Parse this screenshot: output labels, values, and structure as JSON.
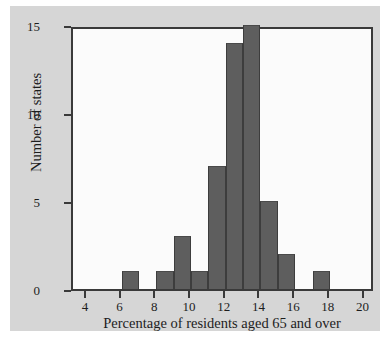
{
  "chart_data": {
    "type": "bar",
    "subtype": "histogram",
    "title": "",
    "xlabel": "Percentage of residents aged 65 and over",
    "ylabel": "Number of states",
    "xlim": [
      3.2,
      20.6
    ],
    "ylim": [
      0,
      15
    ],
    "grid": false,
    "legend": null,
    "bin_width": 1,
    "bar_color": "#5e5e5e",
    "bar_edge_color": "#3d3d3d",
    "plot_background": "#fbfbfb",
    "figure_background": "#d6d6d6",
    "page_background": "#ffffff",
    "axis_color": "#3a3a3a",
    "xticks": [
      4,
      6,
      8,
      10,
      12,
      14,
      16,
      18,
      20
    ],
    "xtick_labels": [
      "4",
      "6",
      "8",
      "10",
      "12",
      "14",
      "16",
      "18",
      "20"
    ],
    "yticks": [
      0,
      5,
      10,
      15
    ],
    "ytick_labels": [
      "0",
      "5",
      "10",
      "15"
    ],
    "bins": [
      {
        "left": 6,
        "right": 7,
        "count": 1
      },
      {
        "left": 8,
        "right": 9,
        "count": 1
      },
      {
        "left": 9,
        "right": 10,
        "count": 3
      },
      {
        "left": 10,
        "right": 11,
        "count": 1
      },
      {
        "left": 11,
        "right": 12,
        "count": 7
      },
      {
        "left": 12,
        "right": 13,
        "count": 14
      },
      {
        "left": 13,
        "right": 14,
        "count": 15
      },
      {
        "left": 14,
        "right": 15,
        "count": 5
      },
      {
        "left": 15,
        "right": 16,
        "count": 2
      },
      {
        "left": 17,
        "right": 18,
        "count": 1
      }
    ],
    "categories": [
      "6-7",
      "8-9",
      "9-10",
      "10-11",
      "11-12",
      "12-13",
      "13-14",
      "14-15",
      "15-16",
      "17-18"
    ],
    "values": [
      1,
      1,
      3,
      1,
      7,
      14,
      15,
      5,
      2,
      1
    ]
  }
}
